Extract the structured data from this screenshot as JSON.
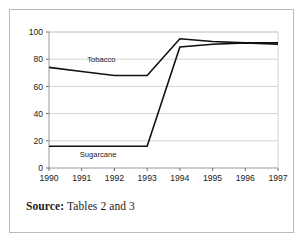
{
  "figure": {
    "source_label": "Source:",
    "source_text": " Tables 2 and 3"
  },
  "chart_data": {
    "type": "line",
    "title": "",
    "xlabel": "",
    "ylabel": "",
    "x": [
      1990,
      1991,
      1992,
      1993,
      1994,
      1995,
      1996,
      1997
    ],
    "categories": [
      "1990",
      "1991",
      "1992",
      "1993",
      "1994",
      "1995",
      "1996",
      "1997"
    ],
    "xlim": [
      1990,
      1997
    ],
    "ylim": [
      0,
      100
    ],
    "yticks": [
      0,
      20,
      40,
      60,
      80,
      100
    ],
    "ytick_labels": [
      "0",
      "20",
      "40",
      "60",
      "80",
      "100"
    ],
    "grid": true,
    "grid_axis": "y",
    "grid_color": "#d4d4d4",
    "legend_position": "inline-annotation",
    "line_color": "#111111",
    "series": [
      {
        "name": "Tobacco",
        "label": "Tobacco",
        "values": [
          74,
          71,
          68,
          68,
          95,
          93,
          92,
          92
        ],
        "label_x": 1991.6,
        "label_y": 78
      },
      {
        "name": "Sugarcane",
        "label": "Sugarcane",
        "values": [
          16,
          16,
          16,
          16,
          89,
          91,
          92,
          91
        ],
        "label_x": 1991.5,
        "label_y": 8
      }
    ]
  }
}
